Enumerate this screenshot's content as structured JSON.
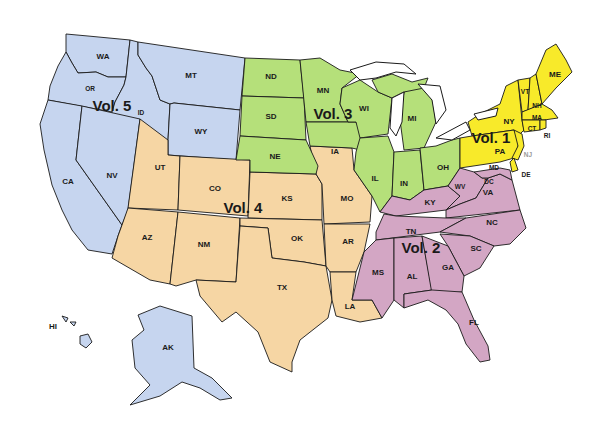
{
  "map": {
    "title": "US Regional Volumes Map",
    "regions": [
      {
        "id": "vol1",
        "label": "Vol. 1",
        "color": "#f8ea2a",
        "states": [
          "ME",
          "VT",
          "NH",
          "MA",
          "CT",
          "RI",
          "NY",
          "PA",
          "NJ",
          "DE"
        ]
      },
      {
        "id": "vol2",
        "label": "Vol. 2",
        "color": "#d3a6c4",
        "states": [
          "WV",
          "VA",
          "DC",
          "MD",
          "KY",
          "TN",
          "NC",
          "SC",
          "MS",
          "AL",
          "GA",
          "FL"
        ]
      },
      {
        "id": "vol3",
        "label": "Vol. 3",
        "color": "#b5e07a",
        "states": [
          "ND",
          "SD",
          "NE",
          "MN",
          "IA",
          "WI",
          "IL",
          "IN",
          "MI",
          "OH"
        ]
      },
      {
        "id": "vol4",
        "label": "Vol. 4",
        "color": "#f6d6a4",
        "states": [
          "UT",
          "CO",
          "AZ",
          "NM",
          "KS",
          "OK",
          "TX",
          "MO",
          "AR",
          "LA"
        ]
      },
      {
        "id": "vol5",
        "label": "Vol. 5",
        "color": "#c6d5ef",
        "states": [
          "WA",
          "OR",
          "ID",
          "MT",
          "WY",
          "CA",
          "NV",
          "AK",
          "HI"
        ]
      }
    ],
    "state_labels": {
      "WA": "WA",
      "OR": "OR",
      "ID": "ID",
      "MT": "MT",
      "WY": "WY",
      "CA": "CA",
      "NV": "NV",
      "AK": "AK",
      "HI": "HI",
      "UT": "UT",
      "CO": "CO",
      "AZ": "AZ",
      "NM": "NM",
      "KS": "KS",
      "OK": "OK",
      "TX": "TX",
      "MO": "MO",
      "AR": "AR",
      "LA": "LA",
      "ND": "ND",
      "SD": "SD",
      "NE": "NE",
      "MN": "MN",
      "IA": "IA",
      "WI": "WI",
      "IL": "IL",
      "IN": "IN",
      "MI": "MI",
      "OH": "OH",
      "KY": "KY",
      "WV": "WV",
      "VA": "VA",
      "DC": "DC",
      "MD": "MD",
      "TN": "TN",
      "NC": "NC",
      "SC": "SC",
      "MS": "MS",
      "AL": "AL",
      "GA": "GA",
      "FL": "FL",
      "ME": "ME",
      "VT": "VT",
      "NH": "NH",
      "MA": "MA",
      "CT": "CT",
      "RI": "RI",
      "NY": "NY",
      "PA": "PA",
      "NJ": "NJ",
      "DE": "DE"
    }
  }
}
